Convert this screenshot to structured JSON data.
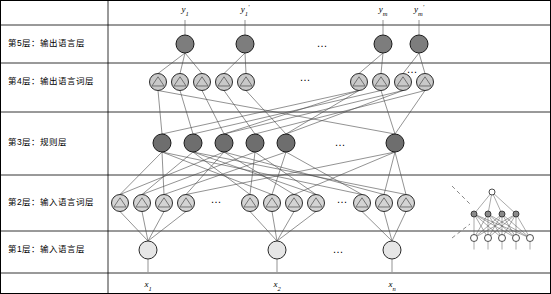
{
  "figure": {
    "title": "",
    "background": "#ffffff"
  },
  "layers": [
    {
      "id": "layer5",
      "label": "第5层：输出语言层",
      "y": 44,
      "node_fill": "#7d7d7d",
      "node_stroke": "#1a1a1a"
    },
    {
      "id": "layer4",
      "label": "第4层：输出语言词层",
      "y": 82,
      "node_fill": "#c9c9c9",
      "node_stroke": "#2a2a2a"
    },
    {
      "id": "layer3",
      "label": "第3层：规则层",
      "y": 143,
      "node_fill": "#6e6e6e",
      "node_stroke": "#1a1a1a"
    },
    {
      "id": "layer2",
      "label": "第2层：输入语言词层",
      "y": 203,
      "node_fill": "#d4d4d4",
      "node_stroke": "#2a2a2a"
    },
    {
      "id": "layer1",
      "label": "第1层：输入语言层",
      "y": 250,
      "node_fill": "#e6e6e6",
      "node_stroke": "#2a2a2a"
    }
  ],
  "layer_divider_ys": [
    25,
    63,
    112,
    175,
    231,
    273
  ],
  "label_x": 36,
  "top_labels": [
    {
      "text": "y",
      "sub": "1",
      "sup": "",
      "x": 185
    },
    {
      "text": "y",
      "sub": "1",
      "sup": "'",
      "x": 245
    },
    {
      "text": "y",
      "sub": "m",
      "sup": "",
      "x": 383
    },
    {
      "text": "y",
      "sub": "m",
      "sup": "'",
      "x": 419
    }
  ],
  "bottom_labels": [
    {
      "text": "x",
      "sub": "1",
      "x": 148
    },
    {
      "text": "x",
      "sub": "2",
      "x": 277
    },
    {
      "text": "x",
      "sub": "n",
      "x": 392
    }
  ],
  "nodes": {
    "layer5": [
      {
        "cx": 185,
        "cy": 44,
        "r": 9
      },
      {
        "cx": 245,
        "cy": 44,
        "r": 9
      },
      {
        "cx": 383,
        "cy": 44,
        "r": 9
      },
      {
        "cx": 419,
        "cy": 44,
        "r": 9
      }
    ],
    "layer4": [
      {
        "cx": 158,
        "cy": 82,
        "r": 8.5
      },
      {
        "cx": 180,
        "cy": 82,
        "r": 8.5
      },
      {
        "cx": 202,
        "cy": 82,
        "r": 8.5
      },
      {
        "cx": 224,
        "cy": 82,
        "r": 8.5
      },
      {
        "cx": 246,
        "cy": 82,
        "r": 8.5
      },
      {
        "cx": 359,
        "cy": 82,
        "r": 8.5
      },
      {
        "cx": 381,
        "cy": 82,
        "r": 8.5
      },
      {
        "cx": 403,
        "cy": 82,
        "r": 8.5
      },
      {
        "cx": 425,
        "cy": 82,
        "r": 8.5
      }
    ],
    "layer3": [
      {
        "cx": 162,
        "cy": 143,
        "r": 9
      },
      {
        "cx": 193,
        "cy": 143,
        "r": 9
      },
      {
        "cx": 224,
        "cy": 143,
        "r": 9
      },
      {
        "cx": 255,
        "cy": 143,
        "r": 9
      },
      {
        "cx": 286,
        "cy": 143,
        "r": 9
      },
      {
        "cx": 395,
        "cy": 143,
        "r": 9
      }
    ],
    "layer2": [
      {
        "cx": 120,
        "cy": 203,
        "r": 8.5
      },
      {
        "cx": 142,
        "cy": 203,
        "r": 8.5
      },
      {
        "cx": 164,
        "cy": 203,
        "r": 8.5
      },
      {
        "cx": 186,
        "cy": 203,
        "r": 8.5
      },
      {
        "cx": 250,
        "cy": 203,
        "r": 8.5
      },
      {
        "cx": 272,
        "cy": 203,
        "r": 8.5
      },
      {
        "cx": 294,
        "cy": 203,
        "r": 8.5
      },
      {
        "cx": 316,
        "cy": 203,
        "r": 8.5
      },
      {
        "cx": 362,
        "cy": 203,
        "r": 8.5
      },
      {
        "cx": 384,
        "cy": 203,
        "r": 8.5
      },
      {
        "cx": 406,
        "cy": 203,
        "r": 8.5
      }
    ],
    "layer1": [
      {
        "cx": 148,
        "cy": 250,
        "r": 9
      },
      {
        "cx": 277,
        "cy": 250,
        "r": 9
      },
      {
        "cx": 392,
        "cy": 250,
        "r": 9
      }
    ]
  },
  "ellipses": [
    {
      "x": 322,
      "y": 44,
      "text": "…"
    },
    {
      "x": 305,
      "y": 78,
      "text": "…"
    },
    {
      "x": 340,
      "y": 143,
      "text": "…"
    },
    {
      "x": 216,
      "y": 200,
      "text": "…"
    },
    {
      "x": 342,
      "y": 200,
      "text": "…"
    },
    {
      "x": 338,
      "y": 250,
      "text": "…"
    },
    {
      "x": 412,
      "y": 70,
      "text": "…"
    }
  ],
  "callout": {
    "line": {
      "x1": 452,
      "y1": 186,
      "x2": 470,
      "y2": 204
    },
    "line2": {
      "x1": 452,
      "y1": 238,
      "x2": 470,
      "y2": 224
    },
    "mini_network": {
      "top_nodes": [
        {
          "cx": 492,
          "cy": 192,
          "r": 3
        }
      ],
      "mid_nodes": [
        {
          "cx": 474,
          "cy": 214,
          "r": 3
        },
        {
          "cx": 488,
          "cy": 214,
          "r": 3
        },
        {
          "cx": 502,
          "cy": 214,
          "r": 3
        },
        {
          "cx": 516,
          "cy": 214,
          "r": 3
        }
      ],
      "bottom_nodes": [
        {
          "cx": 474,
          "cy": 238,
          "r": 3.5
        },
        {
          "cx": 488,
          "cy": 238,
          "r": 3.5
        },
        {
          "cx": 502,
          "cy": 238,
          "r": 3.5
        },
        {
          "cx": 516,
          "cy": 238,
          "r": 3.5
        },
        {
          "cx": 530,
          "cy": 238,
          "r": 3.5
        }
      ]
    }
  },
  "style": {
    "edge_color": "#4a4a4a",
    "node_dark": "#6e6e6e",
    "node_mid": "#c9c9c9",
    "node_light": "#e6e6e6",
    "border": "#000000"
  }
}
